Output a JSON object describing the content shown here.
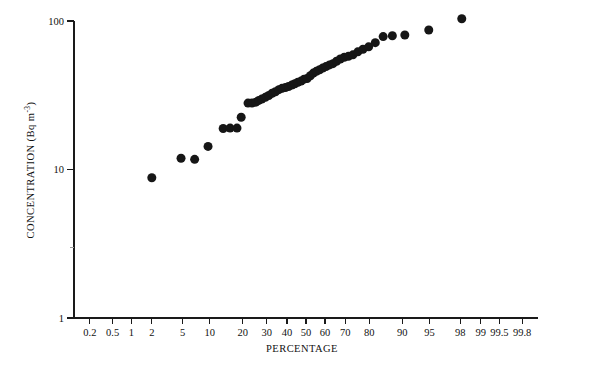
{
  "chart_data": {
    "type": "scatter",
    "title": "",
    "subtitle": "",
    "xlabel": "PERCENTAGE",
    "ylabel": "CONCENTRATION (Bq m-3)",
    "ylabel_parts": {
      "main": "CONCENTRATION (Bq m",
      "exponent": "-3",
      "tail": ")"
    },
    "xscale": "probability",
    "yscale": "log",
    "xlim": [
      0.1,
      99.9
    ],
    "ylim": [
      1,
      100
    ],
    "grid": false,
    "legend": null,
    "marker": {
      "shape": "circle",
      "color": "#161616",
      "size_px": 9
    },
    "xticks": [
      {
        "value": 0.2,
        "label": "0.2"
      },
      {
        "value": 0.5,
        "label": "0.5"
      },
      {
        "value": 1,
        "label": "1"
      },
      {
        "value": 2,
        "label": "2"
      },
      {
        "value": 5,
        "label": "5"
      },
      {
        "value": 10,
        "label": "10"
      },
      {
        "value": 20,
        "label": "20"
      },
      {
        "value": 30,
        "label": "30"
      },
      {
        "value": 40,
        "label": "40"
      },
      {
        "value": 50,
        "label": "50"
      },
      {
        "value": 60,
        "label": "60"
      },
      {
        "value": 70,
        "label": "70"
      },
      {
        "value": 80,
        "label": "80"
      },
      {
        "value": 90,
        "label": "90"
      },
      {
        "value": 95,
        "label": "95"
      },
      {
        "value": 98,
        "label": "98"
      },
      {
        "value": 99,
        "label": "99"
      },
      {
        "value": 99.5,
        "label": "99.5"
      },
      {
        "value": 99.8,
        "label": "99.8"
      }
    ],
    "yticks": [
      {
        "value": 1,
        "label": "1",
        "minor": false
      },
      {
        "value": 3,
        "label": "",
        "minor": true
      },
      {
        "value": 10,
        "label": "10",
        "minor": false
      },
      {
        "value": 100,
        "label": "100",
        "minor": false
      }
    ],
    "points": [
      {
        "x": 2.0,
        "y": 8.8
      },
      {
        "x": 4.8,
        "y": 11.9
      },
      {
        "x": 6.9,
        "y": 11.7
      },
      {
        "x": 9.6,
        "y": 14.3
      },
      {
        "x": 13.5,
        "y": 18.9
      },
      {
        "x": 15.6,
        "y": 19.0
      },
      {
        "x": 17.9,
        "y": 19.0
      },
      {
        "x": 19.4,
        "y": 22.5
      },
      {
        "x": 22.0,
        "y": 28.0
      },
      {
        "x": 23.6,
        "y": 28.0
      },
      {
        "x": 25.2,
        "y": 28.4
      },
      {
        "x": 26.5,
        "y": 29.2
      },
      {
        "x": 27.8,
        "y": 29.8
      },
      {
        "x": 29.4,
        "y": 30.6
      },
      {
        "x": 31.0,
        "y": 31.5
      },
      {
        "x": 32.6,
        "y": 32.6
      },
      {
        "x": 34.2,
        "y": 33.4
      },
      {
        "x": 35.9,
        "y": 34.5
      },
      {
        "x": 37.5,
        "y": 35.2
      },
      {
        "x": 39.2,
        "y": 35.6
      },
      {
        "x": 40.8,
        "y": 36.2
      },
      {
        "x": 42.5,
        "y": 37.0
      },
      {
        "x": 44.1,
        "y": 37.8
      },
      {
        "x": 45.7,
        "y": 38.7
      },
      {
        "x": 47.4,
        "y": 39.4
      },
      {
        "x": 49.0,
        "y": 40.6
      },
      {
        "x": 50.6,
        "y": 41.0
      },
      {
        "x": 52.3,
        "y": 42.8
      },
      {
        "x": 53.9,
        "y": 44.6
      },
      {
        "x": 55.5,
        "y": 45.8
      },
      {
        "x": 57.2,
        "y": 47.0
      },
      {
        "x": 58.8,
        "y": 48.2
      },
      {
        "x": 60.5,
        "y": 49.3
      },
      {
        "x": 62.3,
        "y": 50.6
      },
      {
        "x": 64.0,
        "y": 51.6
      },
      {
        "x": 65.8,
        "y": 53.6
      },
      {
        "x": 67.6,
        "y": 55.5
      },
      {
        "x": 69.5,
        "y": 57.0
      },
      {
        "x": 71.4,
        "y": 57.8
      },
      {
        "x": 73.4,
        "y": 59.2
      },
      {
        "x": 75.5,
        "y": 62.0
      },
      {
        "x": 77.6,
        "y": 64.5
      },
      {
        "x": 79.8,
        "y": 67.0
      },
      {
        "x": 82.2,
        "y": 71.5
      },
      {
        "x": 84.8,
        "y": 78.5
      },
      {
        "x": 87.5,
        "y": 79.5
      },
      {
        "x": 90.6,
        "y": 80.5
      },
      {
        "x": 94.9,
        "y": 87.0
      },
      {
        "x": 98.1,
        "y": 103.5
      }
    ]
  }
}
